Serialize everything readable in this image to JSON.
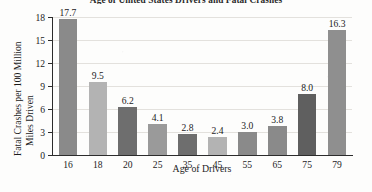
{
  "chart_data": {
    "type": "bar",
    "title": "Age of United States Drivers and Fatal Crashes",
    "xlabel": "Age of Drivers",
    "ylabel_line1": "Fatal Crashes per 100 Million",
    "ylabel_line2": "Miles Driven",
    "categories": [
      "16",
      "18",
      "20",
      "25",
      "35",
      "45",
      "55",
      "65",
      "75",
      "79"
    ],
    "values": [
      17.7,
      9.5,
      6.2,
      4.1,
      2.8,
      2.4,
      3.0,
      3.8,
      8.0,
      16.3
    ],
    "value_labels": [
      "17.7",
      "9.5",
      "6.2",
      "4.1",
      "2.8",
      "2.4",
      "3.0",
      "3.8",
      "8.0",
      "16.3"
    ],
    "bar_colors": [
      "#8a8a8a",
      "#b3b3b3",
      "#6e6e6e",
      "#9a9a9a",
      "#6e6e6e",
      "#b3b3b3",
      "#8a8a8a",
      "#8a8a8a",
      "#5f5f5f",
      "#8f8f8f"
    ],
    "ylim": [
      0,
      18
    ],
    "yticks": [
      0,
      3,
      6,
      9,
      12,
      15,
      18
    ],
    "ytick_labels": [
      "0",
      "3",
      "6",
      "9",
      "12",
      "15",
      "18"
    ],
    "grid": true,
    "legend": false,
    "gridline_color": "#e3e1dd",
    "axis_color": "#2c2c2c",
    "background_color": "#fdfdfc"
  }
}
